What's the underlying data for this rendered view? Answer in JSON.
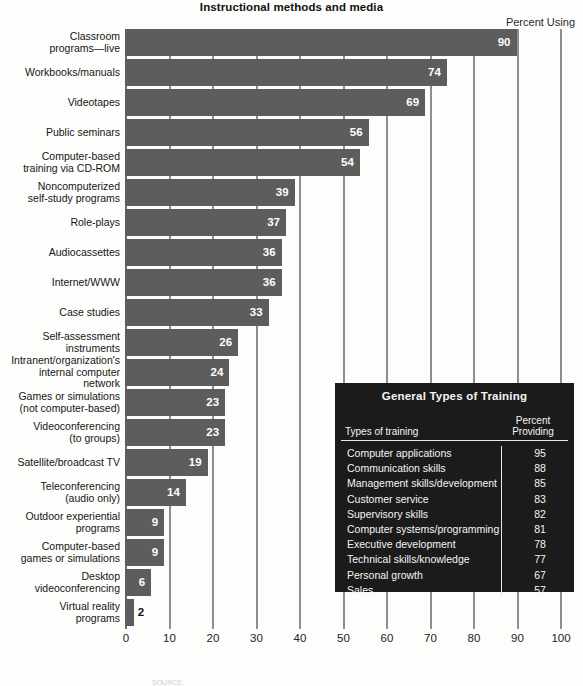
{
  "chart_data": {
    "type": "bar",
    "orientation": "horizontal",
    "title": "Instructional methods and media",
    "value_axis_label": "Percent Using",
    "xlabel": "",
    "ylabel": "",
    "xlim": [
      0,
      100
    ],
    "xticks": [
      0,
      10,
      20,
      30,
      40,
      50,
      60,
      70,
      80,
      90,
      100
    ],
    "grid": true,
    "legend": "none",
    "bar_color": "#5d5d5d",
    "categories": [
      "Classroom\nprograms—live",
      "Workbooks/manuals",
      "Videotapes",
      "Public seminars",
      "Computer-based\ntraining via CD-ROM",
      "Noncomputerized\nself-study programs",
      "Role-plays",
      "Audiocassettes",
      "Internet/WWW",
      "Case studies",
      "Self-assessment\ninstruments",
      "Intranent/organization's\ninternal computer\nnetwork",
      "Games or simulations\n(not computer-based)",
      "Videoconferencing\n(to groups)",
      "Satellite/broadcast TV",
      "Teleconferencing\n(audio only)",
      "Outdoor experiential\nprograms",
      "Computer-based\ngames or simulations",
      "Desktop\nvideoconferencing",
      "Virtual reality\nprograms"
    ],
    "values": [
      90,
      74,
      69,
      56,
      54,
      39,
      37,
      36,
      36,
      33,
      26,
      24,
      23,
      23,
      19,
      14,
      9,
      9,
      6,
      2
    ]
  },
  "header": {
    "title": "Instructional methods and media",
    "percent_using": "Percent Using"
  },
  "bars": [
    {
      "label_lines": [
        "Classroom",
        "programs—live"
      ],
      "value": 90,
      "value_text": "90",
      "inside": true
    },
    {
      "label_lines": [
        "Workbooks/manuals"
      ],
      "value": 74,
      "value_text": "74",
      "inside": true
    },
    {
      "label_lines": [
        "Videotapes"
      ],
      "value": 69,
      "value_text": "69",
      "inside": true
    },
    {
      "label_lines": [
        "Public seminars"
      ],
      "value": 56,
      "value_text": "56",
      "inside": true
    },
    {
      "label_lines": [
        "Computer-based",
        "training via CD-ROM"
      ],
      "value": 54,
      "value_text": "54",
      "inside": true
    },
    {
      "label_lines": [
        "Noncomputerized",
        "self-study programs"
      ],
      "value": 39,
      "value_text": "39",
      "inside": true
    },
    {
      "label_lines": [
        "Role-plays"
      ],
      "value": 37,
      "value_text": "37",
      "inside": true
    },
    {
      "label_lines": [
        "Audiocassettes"
      ],
      "value": 36,
      "value_text": "36",
      "inside": true
    },
    {
      "label_lines": [
        "Internet/WWW"
      ],
      "value": 36,
      "value_text": "36",
      "inside": true
    },
    {
      "label_lines": [
        "Case studies"
      ],
      "value": 33,
      "value_text": "33",
      "inside": true
    },
    {
      "label_lines": [
        "Self-assessment",
        "instruments"
      ],
      "value": 26,
      "value_text": "26",
      "inside": true
    },
    {
      "label_lines": [
        "Intranent/organization's",
        "internal computer",
        "network"
      ],
      "value": 24,
      "value_text": "24",
      "inside": true
    },
    {
      "label_lines": [
        "Games or simulations",
        "(not computer-based)"
      ],
      "value": 23,
      "value_text": "23",
      "inside": true
    },
    {
      "label_lines": [
        "Videoconferencing",
        "(to groups)"
      ],
      "value": 23,
      "value_text": "23",
      "inside": true
    },
    {
      "label_lines": [
        "Satellite/broadcast TV"
      ],
      "value": 19,
      "value_text": "19",
      "inside": true
    },
    {
      "label_lines": [
        "Teleconferencing",
        "(audio only)"
      ],
      "value": 14,
      "value_text": "14",
      "inside": true
    },
    {
      "label_lines": [
        "Outdoor experiential",
        "programs"
      ],
      "value": 9,
      "value_text": "9",
      "inside": true
    },
    {
      "label_lines": [
        "Computer-based",
        "games or simulations"
      ],
      "value": 9,
      "value_text": "9",
      "inside": true
    },
    {
      "label_lines": [
        "Desktop",
        "videoconferencing"
      ],
      "value": 6,
      "value_text": "6",
      "inside": true
    },
    {
      "label_lines": [
        "Virtual reality",
        "programs"
      ],
      "value": 2,
      "value_text": "2",
      "inside": false
    }
  ],
  "axis": {
    "ticks": [
      "0",
      "10",
      "20",
      "30",
      "40",
      "50",
      "60",
      "70",
      "80",
      "90",
      "100"
    ]
  },
  "inset": {
    "title": "General Types of Training",
    "col_types": "Types of training",
    "col_percent_line1": "Percent",
    "col_percent_line2": "Providing",
    "rows": [
      {
        "name": "Computer applications",
        "value": "95"
      },
      {
        "name": "Communication skills",
        "value": "88"
      },
      {
        "name": "Management skills/development",
        "value": "85"
      },
      {
        "name": "Customer service",
        "value": "83"
      },
      {
        "name": "Supervisory skills",
        "value": "82"
      },
      {
        "name": "Computer systems/programming",
        "value": "81"
      },
      {
        "name": "Executive development",
        "value": "78"
      },
      {
        "name": "Technical skills/knowledge",
        "value": "77"
      },
      {
        "name": "Personal growth",
        "value": "67"
      },
      {
        "name": "Sales",
        "value": "57"
      }
    ]
  },
  "footer": {
    "source": "SOURCE:"
  }
}
